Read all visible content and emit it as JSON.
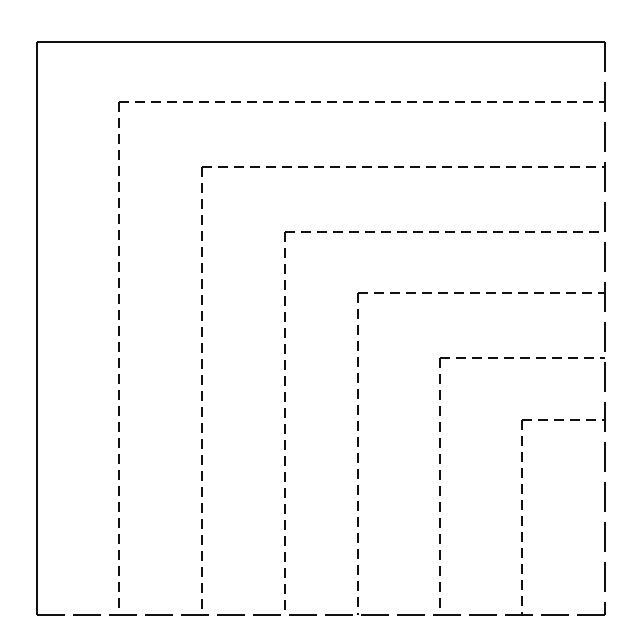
{
  "diagram": {
    "type": "nested-squares",
    "colors": {
      "background": "#ffffff",
      "stroke": "#111111"
    },
    "outer_box": {
      "left": 37,
      "top": 42,
      "right": 605,
      "bottom": 615
    },
    "nested_corners": [
      {
        "x": 119,
        "y": 102
      },
      {
        "x": 202,
        "y": 167
      },
      {
        "x": 285,
        "y": 232
      },
      {
        "x": 358,
        "y": 293
      },
      {
        "x": 440,
        "y": 358
      },
      {
        "x": 522,
        "y": 420
      }
    ],
    "right_edge_style": "long-dash",
    "bottom_edge_style": "long-dash",
    "inner_line_style": "short-dash"
  }
}
